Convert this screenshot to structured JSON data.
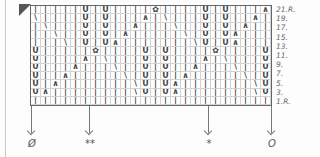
{
  "chart": {
    "columns": 24,
    "legend_symbols": {
      "|": "knit",
      "U": "yarn over",
      "∧": "right-leaning decrease",
      "∖": "left-leaning decrease",
      "✿": "central double decrease"
    },
    "rows": [
      {
        "label": "21.R.",
        "cells": [
          "|",
          "|",
          "|",
          "|",
          "|",
          "U",
          "|",
          "U",
          "|",
          "|",
          "|",
          "|",
          "✿",
          "|",
          "|",
          "|",
          "|",
          "U",
          "|",
          "U",
          "|",
          "|",
          "|",
          "∧"
        ]
      },
      {
        "label": "19.",
        "cells": [
          "∖",
          "|",
          "|",
          "|",
          "|",
          "U",
          "|",
          "U",
          "|",
          "|",
          "|",
          "∧",
          "|",
          "∖",
          "|",
          "|",
          "|",
          "U",
          "|",
          "U",
          "|",
          "|",
          "∧",
          "|"
        ]
      },
      {
        "label": "17.",
        "cells": [
          "|",
          "∖",
          "|",
          "|",
          "|",
          "U",
          "|",
          "U",
          "|",
          "|",
          "∧",
          "|",
          "|",
          "|",
          "∖",
          "|",
          "|",
          "U",
          "|",
          "U",
          "|",
          "∧",
          "|",
          "|"
        ]
      },
      {
        "label": "15.",
        "cells": [
          "|",
          "|",
          "∖",
          "|",
          "|",
          "U",
          "|",
          "U",
          "|",
          "∧",
          "|",
          "|",
          "|",
          "|",
          "|",
          "∖",
          "|",
          "U",
          "|",
          "U",
          "∧",
          "|",
          "|",
          "|"
        ]
      },
      {
        "label": "13.",
        "cells": [
          "|",
          "|",
          "|",
          "∖",
          "|",
          "U",
          "|",
          "U",
          "∧",
          "|",
          "|",
          "|",
          "|",
          "|",
          "|",
          "|",
          "∖",
          "U",
          "|",
          "U",
          "∧",
          "|",
          "|",
          "|"
        ]
      },
      {
        "label": "11.",
        "cells": [
          "U",
          "|",
          "|",
          "|",
          "|",
          "|",
          "✿",
          "|",
          "|",
          "|",
          "|",
          "U",
          "|",
          "U",
          "|",
          "|",
          "|",
          "|",
          "✿",
          "|",
          "|",
          "|",
          "|",
          "U"
        ]
      },
      {
        "label": "9.",
        "cells": [
          "U",
          "|",
          "|",
          "|",
          "|",
          "∧",
          "|",
          "∖",
          "|",
          "|",
          "|",
          "U",
          "|",
          "U",
          "|",
          "|",
          "|",
          "∧",
          "|",
          "∖",
          "|",
          "|",
          "|",
          "U"
        ]
      },
      {
        "label": "7.",
        "cells": [
          "U",
          "|",
          "|",
          "|",
          "∧",
          "|",
          "|",
          "|",
          "∖",
          "|",
          "|",
          "U",
          "|",
          "U",
          "|",
          "|",
          "∧",
          "|",
          "|",
          "|",
          "∖",
          "|",
          "|",
          "U"
        ]
      },
      {
        "label": "5.",
        "cells": [
          "U",
          "|",
          "|",
          "∧",
          "|",
          "|",
          "|",
          "|",
          "|",
          "∖",
          "|",
          "U",
          "|",
          "U",
          "|",
          "∧",
          "|",
          "|",
          "|",
          "|",
          "|",
          "∖",
          "|",
          "U"
        ]
      },
      {
        "label": "3.",
        "cells": [
          "U",
          "|",
          "∧",
          "|",
          "|",
          "|",
          "|",
          "|",
          "|",
          "|",
          "∖",
          "U",
          "|",
          "U",
          "∧",
          "|",
          "|",
          "|",
          "|",
          "|",
          "|",
          "|",
          "∖",
          "U"
        ]
      },
      {
        "label": "1.R.",
        "cells": [
          "U",
          "∧",
          "|",
          "|",
          "|",
          "|",
          "|",
          "|",
          "|",
          "|",
          "∖",
          "U",
          "|",
          "U",
          "∧",
          "|",
          "|",
          "|",
          "|",
          "|",
          "|",
          "|",
          "∖",
          "U"
        ]
      },
      {
        "label": "",
        "cells": [
          "|",
          "|",
          "|",
          "|",
          "|",
          "|",
          "|",
          "|",
          "|",
          "|",
          "|",
          "|",
          "|",
          "|",
          "|",
          "|",
          "|",
          "|",
          "|",
          "|",
          "|",
          "|",
          "|",
          "|"
        ]
      }
    ]
  },
  "markers": [
    {
      "label": "Ø",
      "x": 31
    },
    {
      "label": "**",
      "x": 89
    },
    {
      "label": "*",
      "x": 208
    },
    {
      "label": "O",
      "x": 271
    }
  ]
}
